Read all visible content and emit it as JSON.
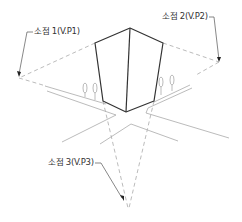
{
  "diagram": {
    "type": "three-point-perspective",
    "labels": {
      "vp1": "소점 1(V.P1)",
      "vp2": "소점 2(V.P2)",
      "vp3": "소점 3(V.P3)"
    },
    "colors": {
      "building_edge": "#333333",
      "road_line": "#aaaaaa",
      "construction_line": "#aaaaaa",
      "leader_line": "#555555",
      "label_text": "#333333"
    }
  }
}
